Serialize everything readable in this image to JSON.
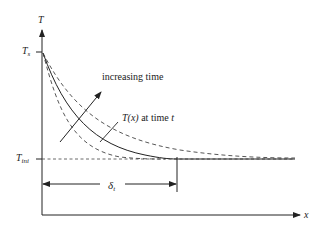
{
  "diagram": {
    "type": "temperature-profile",
    "axes": {
      "y_label": "T",
      "x_label": "x"
    },
    "levels": {
      "surface_label": "T",
      "surface_sub": "s",
      "initial_label": "T",
      "initial_sub": "ini"
    },
    "annotations": {
      "increasing_time": "increasing time",
      "profile_label_prefix": "T(x)",
      "profile_label_suffix": " at time ",
      "profile_label_t": "t",
      "penetration_symbol": "δ",
      "penetration_sub": "t"
    },
    "curves": [
      {
        "name": "earlier-time",
        "style": "dashed"
      },
      {
        "name": "time-t",
        "style": "solid"
      },
      {
        "name": "later-time",
        "style": "dashed"
      }
    ],
    "colors": {
      "line": "#222222",
      "background": "#ffffff"
    }
  }
}
